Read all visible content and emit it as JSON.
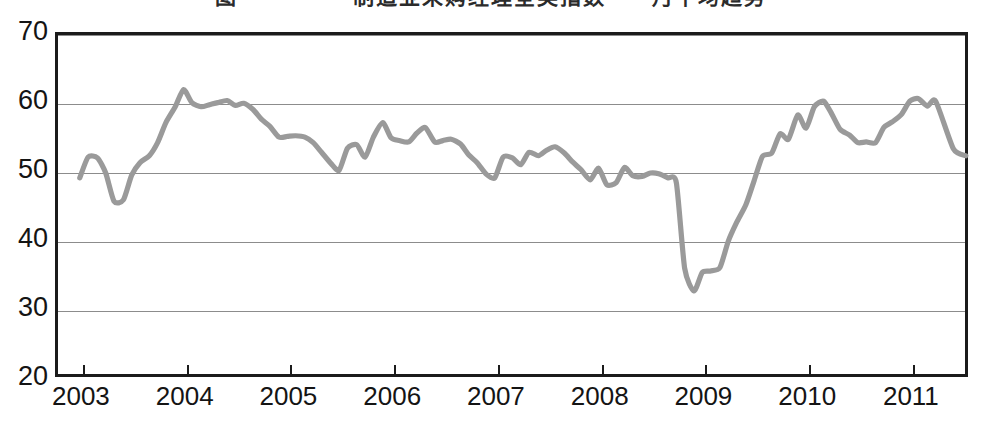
{
  "figure": {
    "title": "图一　　　　制造业采购经理全美指数　　月平均趋势",
    "title_visible_note": "clipped-at-top-edge"
  },
  "chart_data": {
    "type": "line",
    "title": "图一　　　　制造业采购经理全美指数　　月平均趋势",
    "xlabel": "",
    "ylabel": "",
    "ylim": [
      20,
      70
    ],
    "ytick_values": [
      20,
      30,
      40,
      50,
      60,
      70
    ],
    "ytick_labels": [
      "20",
      "30",
      "40",
      "50",
      "60",
      "70"
    ],
    "xtick_labels": [
      "2003",
      "2004",
      "2005",
      "2006",
      "2007",
      "2008",
      "2009",
      "2010",
      "2011"
    ],
    "xtick_values": [
      2003,
      2004,
      2005,
      2006,
      2007,
      2008,
      2009,
      2010,
      2011
    ],
    "xlim": [
      2002.75,
      2011.55
    ],
    "grid": true,
    "grid_axis": "y",
    "legend": false,
    "legend_position": "none",
    "line_color": "#9a9a9a",
    "line_width": 5.2,
    "frame_color": "#1b1b1b",
    "series": [
      {
        "name": "制造业采购经理指数",
        "values": [
          49.3,
          52.3,
          52.2,
          50.0,
          45.9,
          46.1,
          49.7,
          51.5,
          52.5,
          54.4,
          57.3,
          59.6,
          62.1,
          60.2,
          59.6,
          59.9,
          60.2,
          60.5,
          59.8,
          60.1,
          59.2,
          57.8,
          56.8,
          55.2,
          55.3,
          55.4,
          55.2,
          54.4,
          53.0,
          51.4,
          50.4,
          53.6,
          54.1,
          52.3,
          55.2,
          57.3,
          55.1,
          54.7,
          54.5,
          55.8,
          56.6,
          54.5,
          54.7,
          54.9,
          54.2,
          52.6,
          51.5,
          49.8,
          49.3,
          52.3,
          52.2,
          51.2,
          53.0,
          52.5,
          53.3,
          53.8,
          52.9,
          51.6,
          50.5,
          49.0,
          50.7,
          48.3,
          48.6,
          50.8,
          49.6,
          49.5,
          50.0,
          49.9,
          49.3,
          48.6,
          36.2,
          32.9,
          35.6,
          35.8,
          36.3,
          40.1,
          42.8,
          45.4,
          48.9,
          52.4,
          52.9,
          55.7,
          54.9,
          58.4,
          56.5,
          59.6,
          60.4,
          58.5,
          56.3,
          55.5,
          54.4,
          54.5,
          54.4,
          56.6,
          57.4,
          58.5,
          60.4,
          60.8,
          59.7,
          60.4,
          53.5,
          52.5
        ],
        "x": [
          2002.96,
          2003.04,
          2003.13,
          2003.21,
          2003.29,
          2003.38,
          2003.46,
          2003.54,
          2003.63,
          2003.71,
          2003.79,
          2003.88,
          2003.96,
          2004.04,
          2004.13,
          2004.21,
          2004.29,
          2004.38,
          2004.46,
          2004.54,
          2004.63,
          2004.71,
          2004.79,
          2004.88,
          2004.96,
          2005.04,
          2005.13,
          2005.21,
          2005.29,
          2005.38,
          2005.46,
          2005.54,
          2005.63,
          2005.71,
          2005.79,
          2005.88,
          2005.96,
          2006.04,
          2006.13,
          2006.21,
          2006.29,
          2006.38,
          2006.46,
          2006.54,
          2006.63,
          2006.71,
          2006.79,
          2006.88,
          2006.96,
          2007.04,
          2007.13,
          2007.21,
          2007.29,
          2007.38,
          2007.46,
          2007.54,
          2007.63,
          2007.71,
          2007.79,
          2007.88,
          2007.96,
          2008.04,
          2008.13,
          2008.21,
          2008.29,
          2008.38,
          2008.46,
          2008.54,
          2008.63,
          2008.71,
          2008.79,
          2008.88,
          2008.96,
          2009.04,
          2009.13,
          2009.21,
          2009.29,
          2009.38,
          2009.46,
          2009.54,
          2009.63,
          2009.71,
          2009.79,
          2009.88,
          2009.96,
          2010.04,
          2010.13,
          2010.21,
          2010.29,
          2010.38,
          2010.46,
          2010.54,
          2010.63,
          2010.71,
          2010.79,
          2010.88,
          2010.96,
          2011.04,
          2011.13,
          2011.21,
          2011.38,
          2011.5
        ]
      }
    ],
    "annotations": {
      "peak_value": 62.1,
      "peak_label": "2003年末高点",
      "trough_value": 32.9,
      "trough_label": "2008年末低点",
      "neutral_level": 50
    }
  }
}
